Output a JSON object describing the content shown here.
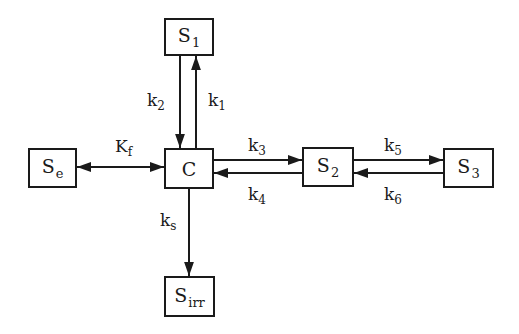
{
  "diagram": {
    "type": "compartment-kinetics",
    "nodes": [
      {
        "id": "S1",
        "base": "S",
        "sub": "1",
        "x": 164,
        "y": 18,
        "w": 50,
        "h": 38
      },
      {
        "id": "C",
        "base": "C",
        "sub": "",
        "x": 164,
        "y": 148,
        "w": 50,
        "h": 41
      },
      {
        "id": "Se",
        "base": "S",
        "sub": "e",
        "x": 28,
        "y": 148,
        "w": 49,
        "h": 40
      },
      {
        "id": "S2",
        "base": "S",
        "sub": "2",
        "x": 302,
        "y": 147,
        "w": 52,
        "h": 40
      },
      {
        "id": "S3",
        "base": "S",
        "sub": "3",
        "x": 443,
        "y": 148,
        "w": 51,
        "h": 40
      },
      {
        "id": "Sirr",
        "base": "S",
        "sub": "irr",
        "x": 164,
        "y": 276,
        "w": 51,
        "h": 41
      }
    ],
    "edges": [
      {
        "from": "S1",
        "to": "C",
        "label_base": "k",
        "label_sub": "2",
        "direction": "down"
      },
      {
        "from": "C",
        "to": "S1",
        "label_base": "k",
        "label_sub": "1",
        "direction": "up"
      },
      {
        "from": "Se",
        "to": "C",
        "label_base": "K",
        "label_sub": "f",
        "direction": "bidirectional"
      },
      {
        "from": "C",
        "to": "S2",
        "label_base": "k",
        "label_sub": "3",
        "direction": "right"
      },
      {
        "from": "S2",
        "to": "C",
        "label_base": "k",
        "label_sub": "4",
        "direction": "left"
      },
      {
        "from": "S2",
        "to": "S3",
        "label_base": "k",
        "label_sub": "5",
        "direction": "right"
      },
      {
        "from": "S3",
        "to": "S2",
        "label_base": "k",
        "label_sub": "6",
        "direction": "left"
      },
      {
        "from": "C",
        "to": "Sirr",
        "label_base": "k",
        "label_sub": "s",
        "direction": "down"
      }
    ]
  },
  "labels": {
    "S1": {
      "base": "S",
      "sub": "1"
    },
    "C": {
      "base": "C"
    },
    "Se": {
      "base": "S",
      "sub": "e"
    },
    "S2": {
      "base": "S",
      "sub": "2"
    },
    "S3": {
      "base": "S",
      "sub": "3"
    },
    "Sirr": {
      "base": "S",
      "sub": "irr"
    },
    "k1": {
      "base": "k",
      "sub": "1"
    },
    "k2": {
      "base": "k",
      "sub": "2"
    },
    "Kf": {
      "base": "K",
      "sub": "f"
    },
    "k3": {
      "base": "k",
      "sub": "3"
    },
    "k4": {
      "base": "k",
      "sub": "4"
    },
    "k5": {
      "base": "k",
      "sub": "5"
    },
    "k6": {
      "base": "k",
      "sub": "6"
    },
    "ks": {
      "base": "k",
      "sub": "s"
    }
  },
  "colors": {
    "stroke": "#1a1a1a",
    "background": "#ffffff"
  }
}
